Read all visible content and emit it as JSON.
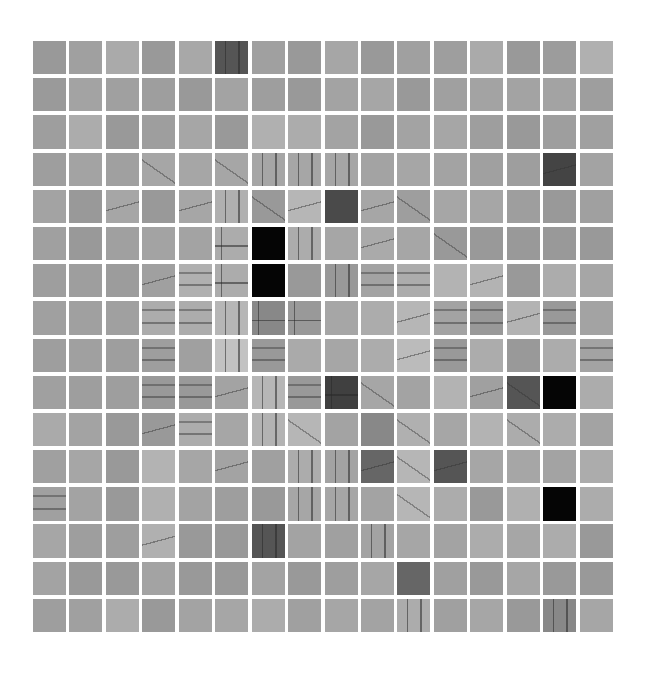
{
  "grid": {
    "rows": 16,
    "cols": 16,
    "background": "#ffffff",
    "tiles": [
      [
        [
          "999999",
          "n"
        ],
        [
          "a0a0a0",
          "n"
        ],
        [
          "aaaaaa",
          "n"
        ],
        [
          "999999",
          "n"
        ],
        [
          "a8a8a8",
          "n"
        ],
        [
          "555555",
          "v"
        ],
        [
          "a0a0a0",
          "n"
        ],
        [
          "999999",
          "n"
        ],
        [
          "a6a6a6",
          "n"
        ],
        [
          "999999",
          "n"
        ],
        [
          "a0a0a0",
          "n"
        ],
        [
          "9e9e9e",
          "n"
        ],
        [
          "aaaaaa",
          "n"
        ],
        [
          "999999",
          "n"
        ],
        [
          "9c9c9c",
          "n"
        ],
        [
          "b0b0b0",
          "n"
        ]
      ],
      [
        [
          "9a9a9a",
          "n"
        ],
        [
          "a3a3a3",
          "n"
        ],
        [
          "a0a0a0",
          "n"
        ],
        [
          "9e9e9e",
          "n"
        ],
        [
          "999999",
          "n"
        ],
        [
          "a3a3a3",
          "n"
        ],
        [
          "9e9e9e",
          "n"
        ],
        [
          "999999",
          "n"
        ],
        [
          "a3a3a3",
          "n"
        ],
        [
          "a6a6a6",
          "n"
        ],
        [
          "999999",
          "n"
        ],
        [
          "a0a0a0",
          "n"
        ],
        [
          "a3a3a3",
          "n"
        ],
        [
          "a3a3a3",
          "n"
        ],
        [
          "a3a3a3",
          "n"
        ],
        [
          "9e9e9e",
          "n"
        ]
      ],
      [
        [
          "9e9e9e",
          "n"
        ],
        [
          "acacac",
          "n"
        ],
        [
          "999999",
          "n"
        ],
        [
          "9e9e9e",
          "n"
        ],
        [
          "a6a6a6",
          "n"
        ],
        [
          "999999",
          "n"
        ],
        [
          "b0b0b0",
          "n"
        ],
        [
          "acacac",
          "n"
        ],
        [
          "a3a3a3",
          "n"
        ],
        [
          "999999",
          "n"
        ],
        [
          "a3a3a3",
          "n"
        ],
        [
          "a6a6a6",
          "n"
        ],
        [
          "9e9e9e",
          "n"
        ],
        [
          "999999",
          "n"
        ],
        [
          "9e9e9e",
          "n"
        ],
        [
          "a0a0a0",
          "n"
        ]
      ],
      [
        [
          "9e9e9e",
          "n"
        ],
        [
          "a3a3a3",
          "n"
        ],
        [
          "a0a0a0",
          "n"
        ],
        [
          "a6a6a6",
          "s"
        ],
        [
          "a6a6a6",
          "n"
        ],
        [
          "a6a6a6",
          "s"
        ],
        [
          "a6a6a6",
          "v"
        ],
        [
          "a6a6a6",
          "v"
        ],
        [
          "a6a6a6",
          "v"
        ],
        [
          "a3a3a3",
          "n"
        ],
        [
          "a6a6a6",
          "n"
        ],
        [
          "a3a3a3",
          "n"
        ],
        [
          "a0a0a0",
          "n"
        ],
        [
          "9e9e9e",
          "n"
        ],
        [
          "444444",
          "d"
        ],
        [
          "a3a3a3",
          "n"
        ]
      ],
      [
        [
          "a3a3a3",
          "n"
        ],
        [
          "999999",
          "n"
        ],
        [
          "a6a6a6",
          "d"
        ],
        [
          "999999",
          "n"
        ],
        [
          "a6a6a6",
          "d"
        ],
        [
          "b0b0b0",
          "v"
        ],
        [
          "999999",
          "s"
        ],
        [
          "b6b6b6",
          "d"
        ],
        [
          "4a4a4a",
          "n"
        ],
        [
          "a6a6a6",
          "d"
        ],
        [
          "9e9e9e",
          "s"
        ],
        [
          "a6a6a6",
          "n"
        ],
        [
          "a6a6a6",
          "n"
        ],
        [
          "9e9e9e",
          "n"
        ],
        [
          "999999",
          "n"
        ],
        [
          "a0a0a0",
          "n"
        ]
      ],
      [
        [
          "a0a0a0",
          "n"
        ],
        [
          "999999",
          "n"
        ],
        [
          "a0a0a0",
          "n"
        ],
        [
          "a3a3a3",
          "n"
        ],
        [
          "a3a3a3",
          "n"
        ],
        [
          "acacac",
          "c"
        ],
        [
          "050505",
          "k"
        ],
        [
          "acacac",
          "v"
        ],
        [
          "a6a6a6",
          "n"
        ],
        [
          "aaaaaa",
          "d"
        ],
        [
          "a6a6a6",
          "n"
        ],
        [
          "999999",
          "s"
        ],
        [
          "999999",
          "n"
        ],
        [
          "999999",
          "n"
        ],
        [
          "999999",
          "n"
        ],
        [
          "999999",
          "n"
        ]
      ],
      [
        [
          "9e9e9e",
          "n"
        ],
        [
          "9e9e9e",
          "n"
        ],
        [
          "9c9c9c",
          "n"
        ],
        [
          "a0a0a0",
          "d"
        ],
        [
          "b0b0b0",
          "h"
        ],
        [
          "acacac",
          "c"
        ],
        [
          "050505",
          "k"
        ],
        [
          "999999",
          "n"
        ],
        [
          "999999",
          "v"
        ],
        [
          "a3a3a3",
          "h"
        ],
        [
          "acacac",
          "h"
        ],
        [
          "b3b3b3",
          "n"
        ],
        [
          "b3b3b3",
          "d"
        ],
        [
          "999999",
          "n"
        ],
        [
          "acacac",
          "n"
        ],
        [
          "a6a6a6",
          "n"
        ]
      ],
      [
        [
          "a0a0a0",
          "n"
        ],
        [
          "a0a0a0",
          "n"
        ],
        [
          "a0a0a0",
          "n"
        ],
        [
          "acacac",
          "h"
        ],
        [
          "acacac",
          "h"
        ],
        [
          "b6b6b6",
          "v"
        ],
        [
          "888888",
          "c"
        ],
        [
          "999999",
          "c"
        ],
        [
          "a6a6a6",
          "n"
        ],
        [
          "acacac",
          "n"
        ],
        [
          "b6b6b6",
          "d"
        ],
        [
          "a3a3a3",
          "h"
        ],
        [
          "999999",
          "h"
        ],
        [
          "b3b3b3",
          "d"
        ],
        [
          "999999",
          "h"
        ],
        [
          "a3a3a3",
          "n"
        ]
      ],
      [
        [
          "9e9e9e",
          "n"
        ],
        [
          "a0a0a0",
          "n"
        ],
        [
          "9e9e9e",
          "n"
        ],
        [
          "9e9e9e",
          "h"
        ],
        [
          "a0a0a0",
          "n"
        ],
        [
          "c2c2c2",
          "v"
        ],
        [
          "999999",
          "h"
        ],
        [
          "aaaaaa",
          "n"
        ],
        [
          "a6a6a6",
          "n"
        ],
        [
          "acacac",
          "n"
        ],
        [
          "bbbbbb",
          "d"
        ],
        [
          "999999",
          "h"
        ],
        [
          "acacac",
          "n"
        ],
        [
          "999999",
          "n"
        ],
        [
          "acacac",
          "n"
        ],
        [
          "a3a3a3",
          "h"
        ]
      ],
      [
        [
          "a0a0a0",
          "n"
        ],
        [
          "9e9e9e",
          "n"
        ],
        [
          "9e9e9e",
          "n"
        ],
        [
          "999999",
          "h"
        ],
        [
          "999999",
          "h"
        ],
        [
          "a3a3a3",
          "d"
        ],
        [
          "b6b6b6",
          "v"
        ],
        [
          "999999",
          "h"
        ],
        [
          "404040",
          "c"
        ],
        [
          "a6a6a6",
          "s"
        ],
        [
          "a3a3a3",
          "n"
        ],
        [
          "b3b3b3",
          "n"
        ],
        [
          "a0a0a0",
          "d"
        ],
        [
          "555555",
          "s"
        ],
        [
          "050505",
          "k"
        ],
        [
          "acacac",
          "n"
        ]
      ],
      [
        [
          "aaaaaa",
          "n"
        ],
        [
          "a3a3a3",
          "n"
        ],
        [
          "999999",
          "n"
        ],
        [
          "999999",
          "d"
        ],
        [
          "acacac",
          "h"
        ],
        [
          "a6a6a6",
          "n"
        ],
        [
          "b3b3b3",
          "v"
        ],
        [
          "b6b6b6",
          "s"
        ],
        [
          "a3a3a3",
          "n"
        ],
        [
          "888888",
          "n"
        ],
        [
          "b0b0b0",
          "s"
        ],
        [
          "a6a6a6",
          "n"
        ],
        [
          "b3b3b3",
          "n"
        ],
        [
          "acacac",
          "s"
        ],
        [
          "acacac",
          "n"
        ],
        [
          "a3a3a3",
          "n"
        ]
      ],
      [
        [
          "a0a0a0",
          "n"
        ],
        [
          "a6a6a6",
          "n"
        ],
        [
          "999999",
          "n"
        ],
        [
          "b3b3b3",
          "n"
        ],
        [
          "a6a6a6",
          "n"
        ],
        [
          "a3a3a3",
          "d"
        ],
        [
          "a0a0a0",
          "n"
        ],
        [
          "acacac",
          "v"
        ],
        [
          "a3a3a3",
          "v"
        ],
        [
          "666666",
          "d"
        ],
        [
          "b6b6b6",
          "s"
        ],
        [
          "555555",
          "d"
        ],
        [
          "a6a6a6",
          "n"
        ],
        [
          "a6a6a6",
          "n"
        ],
        [
          "a3a3a3",
          "n"
        ],
        [
          "acacac",
          "n"
        ]
      ],
      [
        [
          "a0a0a0",
          "h"
        ],
        [
          "a3a3a3",
          "n"
        ],
        [
          "999999",
          "n"
        ],
        [
          "b0b0b0",
          "n"
        ],
        [
          "a3a3a3",
          "n"
        ],
        [
          "9e9e9e",
          "n"
        ],
        [
          "999999",
          "n"
        ],
        [
          "a6a6a6",
          "v"
        ],
        [
          "a6a6a6",
          "v"
        ],
        [
          "a3a3a3",
          "n"
        ],
        [
          "b6b6b6",
          "s"
        ],
        [
          "acacac",
          "n"
        ],
        [
          "999999",
          "n"
        ],
        [
          "b0b0b0",
          "n"
        ],
        [
          "050505",
          "k"
        ],
        [
          "acacac",
          "n"
        ]
      ],
      [
        [
          "a6a6a6",
          "n"
        ],
        [
          "9e9e9e",
          "n"
        ],
        [
          "9e9e9e",
          "n"
        ],
        [
          "b0b0b0",
          "d"
        ],
        [
          "999999",
          "n"
        ],
        [
          "999999",
          "n"
        ],
        [
          "555555",
          "v"
        ],
        [
          "a3a3a3",
          "n"
        ],
        [
          "a0a0a0",
          "n"
        ],
        [
          "a3a3a3",
          "v"
        ],
        [
          "a6a6a6",
          "n"
        ],
        [
          "a3a3a3",
          "n"
        ],
        [
          "acacac",
          "n"
        ],
        [
          "a6a6a6",
          "n"
        ],
        [
          "acacac",
          "n"
        ],
        [
          "999999",
          "n"
        ]
      ],
      [
        [
          "a3a3a3",
          "n"
        ],
        [
          "999999",
          "n"
        ],
        [
          "999999",
          "n"
        ],
        [
          "a3a3a3",
          "n"
        ],
        [
          "999999",
          "n"
        ],
        [
          "999999",
          "n"
        ],
        [
          "a3a3a3",
          "n"
        ],
        [
          "999999",
          "n"
        ],
        [
          "9e9e9e",
          "n"
        ],
        [
          "a6a6a6",
          "n"
        ],
        [
          "666666",
          "n"
        ],
        [
          "a0a0a0",
          "n"
        ],
        [
          "999999",
          "n"
        ],
        [
          "a6a6a6",
          "n"
        ],
        [
          "999999",
          "n"
        ],
        [
          "999999",
          "n"
        ]
      ],
      [
        [
          "9e9e9e",
          "n"
        ],
        [
          "a0a0a0",
          "n"
        ],
        [
          "acacac",
          "n"
        ],
        [
          "999999",
          "n"
        ],
        [
          "a3a3a3",
          "n"
        ],
        [
          "a6a6a6",
          "n"
        ],
        [
          "acacac",
          "n"
        ],
        [
          "a0a0a0",
          "n"
        ],
        [
          "a6a6a6",
          "n"
        ],
        [
          "a3a3a3",
          "n"
        ],
        [
          "acacac",
          "v"
        ],
        [
          "a0a0a0",
          "n"
        ],
        [
          "a6a6a6",
          "n"
        ],
        [
          "999999",
          "n"
        ],
        [
          "888888",
          "v"
        ],
        [
          "a6a6a6",
          "n"
        ]
      ]
    ]
  }
}
